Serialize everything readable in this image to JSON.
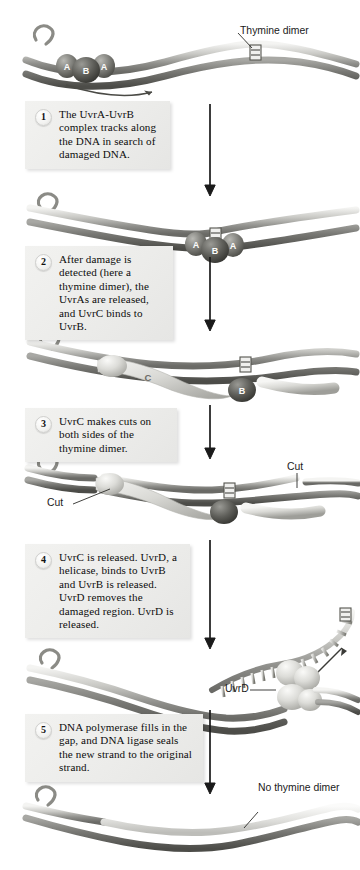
{
  "figure": {
    "domain": "diagram",
    "background_color": "#ffffff",
    "ink_color": "#000000",
    "box_fill": "#eeeeec"
  },
  "steps": [
    {
      "number": "1",
      "text": "The UvrA-UvrB complex tracks along the DNA in search of damaged DNA."
    },
    {
      "number": "2",
      "text": "After damage is detected (here a thymine dimer), the UvrAs are released, and UvrC binds to UvrB."
    },
    {
      "number": "3",
      "text": "UvrC makes cuts on both sides of the thymine dimer."
    },
    {
      "number": "4",
      "text": "UvrC is released. UvrD, a helicase, binds to UvrB and UvrB is released. UvrD removes the damaged region. UvrD is released."
    },
    {
      "number": "5",
      "text": "DNA polymerase fills in the gap, and DNA ligase seals the new strand to the original strand."
    }
  ],
  "labels": {
    "thymine_dimer": "Thymine dimer",
    "cut_left": "Cut",
    "cut_right": "Cut",
    "uvrd": "UvrD",
    "no_thymine_dimer": "No thymine dimer"
  },
  "protein_tags": {
    "panel1": [
      "A",
      "B",
      "A"
    ],
    "panel2": [
      "A",
      "B",
      "A"
    ],
    "panel3": [
      "C",
      "B"
    ],
    "panel4": [
      "C",
      "B"
    ]
  },
  "panels": [
    {
      "id": "panel-1",
      "caption_step": "1",
      "contents": "DNA duplex with UvrA-UvrB-UvrA complex at left and a thymine dimer at right; motion arrow below complex"
    },
    {
      "id": "panel-2",
      "caption_step": "2",
      "contents": "DNA duplex with UvrA-UvrB-UvrA complex positioned at the thymine dimer"
    },
    {
      "id": "panel-3",
      "caption_step": "3",
      "contents": "DNA duplex with UvrC bound beside UvrB at the thymine dimer"
    },
    {
      "id": "panel-4",
      "caption_step": "4",
      "contents": "DNA duplex incised on both sides of the thymine dimer, Cut labels at left and right"
    },
    {
      "id": "panel-5",
      "caption_step": "5",
      "contents": "UvrD helicase unwinding and removing the damaged oligonucleotide from the duplex"
    },
    {
      "id": "panel-6",
      "caption_step": "",
      "contents": "Repaired DNA duplex with newly synthesized strand and no thymine dimer"
    }
  ],
  "arrows": {
    "count": 5,
    "direction": "down",
    "color": "#1a1a1a"
  }
}
